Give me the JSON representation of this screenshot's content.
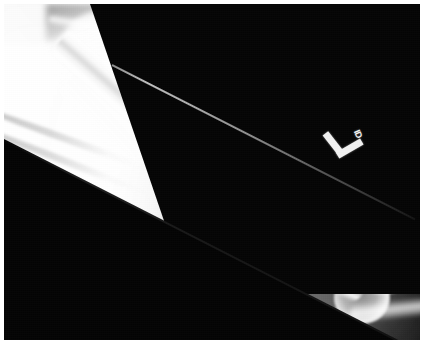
{
  "image": {
    "modality": "X-ray",
    "view": "AP humerus",
    "body_part": "Left upper arm",
    "background_color": "#ffffff",
    "plate_color": "#050505",
    "bone_color": "#ffffff"
  },
  "marker": {
    "side_letter": "L",
    "sub_text": "ID",
    "name": "radiopaque-side-marker"
  },
  "anatomy": {
    "shoulder_label": "Shoulder / humeral head",
    "shaft_label": "Humeral shaft",
    "elbow_label": "Elbow joint",
    "ribs_label": "Rib shadows",
    "ribs_count": 7
  },
  "regions": {
    "collimation_upper_right": "Collimated dark field",
    "collimation_lower_left": "Collimated dark field",
    "beam_streak": "Collimation edge streak"
  }
}
